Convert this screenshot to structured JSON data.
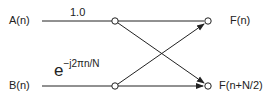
{
  "diagram": {
    "inputs": [
      {
        "label": "A(n)"
      },
      {
        "label": "B(n)"
      }
    ],
    "outputs": [
      {
        "label": "F(n)"
      },
      {
        "label": "F(n+N/2)"
      }
    ],
    "weights": {
      "top": "1.0",
      "bottom_base": "e",
      "bottom_exponent": "−j2πn/N"
    },
    "colors": {
      "line": "#222222",
      "background": "#ffffff"
    }
  }
}
